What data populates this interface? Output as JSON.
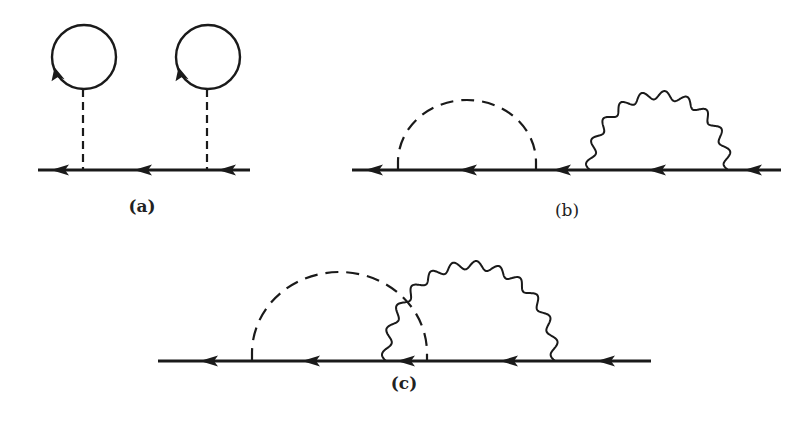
{
  "figure": {
    "stroke_color": "#1a1a1a",
    "background": "#ffffff",
    "diagrams": [
      {
        "id": "a",
        "label": "(a)",
        "label_pos": [
          142,
          196
        ],
        "fermion_line": {
          "y": 170,
          "x_start": 38,
          "x_end": 250
        },
        "arrows_x": [
          62,
          145,
          229
        ],
        "tadpoles": [
          {
            "vertex_x": 83,
            "circle_center": [
              84,
              57
            ],
            "radius": 32
          },
          {
            "vertex_x": 207,
            "circle_center": [
              208,
              57
            ],
            "radius": 32
          }
        ]
      },
      {
        "id": "b",
        "label": "(b)",
        "label_pos": [
          567,
          200
        ],
        "fermion_line": {
          "y": 170,
          "x_start": 352,
          "x_end": 781
        },
        "arrows_x": [
          376,
          470,
          564,
          659,
          755
        ],
        "dashed_arc": {
          "x1": 398,
          "x2": 536,
          "top_y": 100
        },
        "wavy_arc": {
          "x1": 590,
          "x2": 728,
          "top_y": 95,
          "wiggles": 10
        }
      },
      {
        "id": "c",
        "label": "(c)",
        "label_pos": [
          404,
          373
        ],
        "fermion_line": {
          "y": 361,
          "x_start": 158,
          "x_end": 651
        },
        "arrows_x": [
          211,
          313,
          408,
          511,
          608
        ],
        "dashed_arc": {
          "x1": 252,
          "x2": 427,
          "top_y": 272
        },
        "wavy_arc": {
          "x1": 386,
          "x2": 555,
          "top_y": 265,
          "wiggles": 12
        }
      }
    ]
  }
}
